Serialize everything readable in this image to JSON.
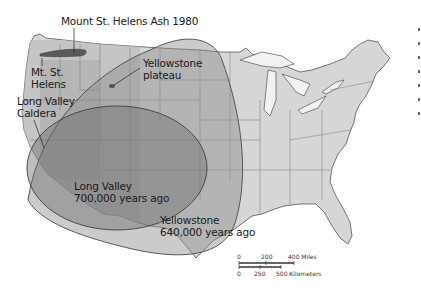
{
  "map": {
    "subject": "Volcanic ash fall extents over the contiguous United States",
    "labels": {
      "st_helens_ash": "Mount St. Helens Ash 1980",
      "mt_st_helens_line1": "Mt. St.",
      "mt_st_helens_line2": "Helens",
      "yellowstone_plateau_line1": "Yellowstone",
      "yellowstone_plateau_line2": "plateau",
      "long_valley_caldera_line1": "Long Valley",
      "long_valley_caldera_line2": "Caldera",
      "long_valley_ash_line1": "Long Valley",
      "long_valley_ash_line2": "700,000 years ago",
      "yellowstone_ash_line1": "Yellowstone",
      "yellowstone_ash_line2": "640,000 years ago"
    },
    "scale_bar": {
      "miles_ticks": [
        "0",
        "200",
        "400 Miles"
      ],
      "km_ticks": [
        "0",
        "250",
        "500 Kilometers"
      ]
    },
    "colors": {
      "land": "#d6d6d6",
      "land_dark": "#bdbdbd",
      "water": "#ffffff",
      "yellowstone_fill": "#9a9a9a",
      "long_valley_fill": "#7e7e7e",
      "outline": "#4a4a4a",
      "text": "#1a1a1a"
    }
  }
}
